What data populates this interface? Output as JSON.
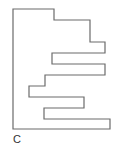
{
  "diagram": {
    "type": "polygon-outline",
    "stroke_color": "#6b6b6b",
    "fill_color": "#ffffff",
    "stroke_width": 1.2,
    "points": "13,9 54,9 54,20 90,20 90,42 105,42 105,53 52,53 52,64 105,64 105,75 45,75 45,86 29,86 29,97 84,97 84,108 44,108 44,119 110,119 110,129 13,129",
    "label": "C"
  }
}
